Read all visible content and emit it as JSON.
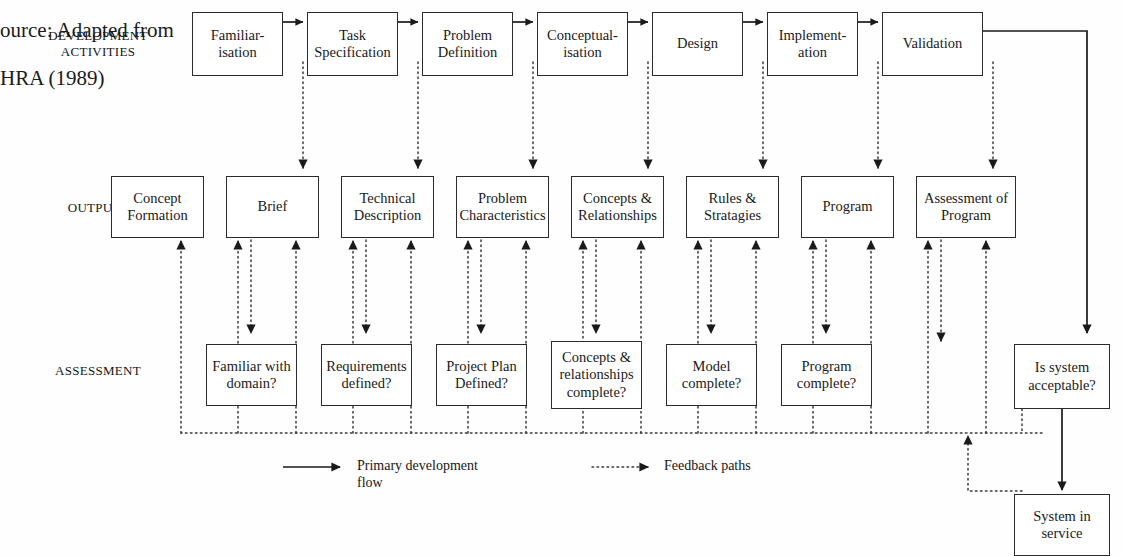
{
  "caption": {
    "line1": "ource: Adapted from",
    "line2": "HRA (1989)"
  },
  "row_labels": [
    {
      "id": "development-activities",
      "line1": "DEVELOPMENT",
      "line2": "ACTIVITIES"
    },
    {
      "id": "outputs",
      "line1": "OUTPUTS",
      "line2": ""
    },
    {
      "id": "assessment",
      "line1": "ASSESSMENT",
      "line2": ""
    }
  ],
  "development_activities": [
    {
      "id": "familiarisation",
      "line1": "Familiar-",
      "line2": "isation"
    },
    {
      "id": "task-specification",
      "line1": "Task",
      "line2": "Specification"
    },
    {
      "id": "problem-definition",
      "line1": "Problem",
      "line2": "Definition"
    },
    {
      "id": "conceptualisation",
      "line1": "Conceptual-",
      "line2": "isation"
    },
    {
      "id": "design",
      "line1": "Design",
      "line2": ""
    },
    {
      "id": "implementation",
      "line1": "Implement-",
      "line2": "ation"
    },
    {
      "id": "validation",
      "line1": "Validation",
      "line2": ""
    }
  ],
  "outputs": [
    {
      "id": "concept-formation",
      "line1": "Concept",
      "line2": "Formation"
    },
    {
      "id": "brief",
      "line1": "Brief",
      "line2": ""
    },
    {
      "id": "technical-description",
      "line1": "Technical",
      "line2": "Description"
    },
    {
      "id": "problem-characteristics",
      "line1": "Problem",
      "line2": "Characteristics"
    },
    {
      "id": "concepts-relationships",
      "line1": "Concepts &",
      "line2": "Relationships"
    },
    {
      "id": "rules-stratagies",
      "line1": "Rules &",
      "line2": "Stratagies"
    },
    {
      "id": "program",
      "line1": "Program",
      "line2": ""
    },
    {
      "id": "assessment-of-program",
      "line1": "Assessment of",
      "line2": "Program"
    }
  ],
  "assessment": [
    {
      "id": "familiar-with-domain",
      "line1": "Familiar with",
      "line2": "domain?",
      "line3": ""
    },
    {
      "id": "requirements-defined",
      "line1": "Requirements",
      "line2": "defined?",
      "line3": ""
    },
    {
      "id": "project-plan-defined",
      "line1": "Project Plan",
      "line2": "Defined?",
      "line3": ""
    },
    {
      "id": "concepts-relationships-complete",
      "line1": "Concepts &",
      "line2": "relationships",
      "line3": "complete?"
    },
    {
      "id": "model-complete",
      "line1": "Model",
      "line2": "complete?",
      "line3": ""
    },
    {
      "id": "program-complete",
      "line1": "Program",
      "line2": "complete?",
      "line3": ""
    }
  ],
  "decision": {
    "id": "is-system-acceptable",
    "line1": "Is system",
    "line2": "acceptable?"
  },
  "terminal": {
    "id": "system-in-service",
    "line1": "System in",
    "line2": "service"
  },
  "legend": {
    "primary": {
      "line1": "Primary development",
      "line2": "flow"
    },
    "feedback": {
      "line1": "Feedback paths",
      "line2": ""
    }
  },
  "colors": {
    "stroke": "#2b2b2b",
    "background": "#fefefe",
    "text": "#1a1a1a"
  }
}
